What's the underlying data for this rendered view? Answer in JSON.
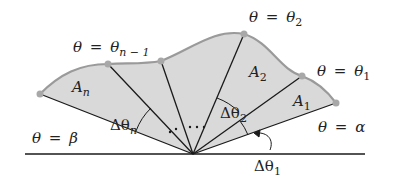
{
  "diagram": {
    "type": "polar-area-sectors",
    "colors": {
      "region_fill": "#d9d9d9",
      "curve_stroke": "#9a9a9a",
      "ray_stroke": "#1a1a1a",
      "point_fill": "#a8a8a8",
      "text": "#222222"
    },
    "origin": {
      "x": 193,
      "y": 154
    },
    "baseline": {
      "x1": 25,
      "x2": 365,
      "y": 154
    },
    "curve_points": [
      {
        "x": 40,
        "y": 94
      },
      {
        "x": 108,
        "y": 64
      },
      {
        "x": 161,
        "y": 61
      },
      {
        "x": 244,
        "y": 34
      },
      {
        "x": 302,
        "y": 76
      },
      {
        "x": 336,
        "y": 103
      }
    ],
    "labels": {
      "theta_n_minus_1": {
        "lhs": "θ",
        "eq": "=",
        "rhs": "θ",
        "sub": "n − 1"
      },
      "theta_2": {
        "lhs": "θ",
        "eq": "=",
        "rhs": "θ",
        "sub": "2"
      },
      "theta_1": {
        "lhs": "θ",
        "eq": "=",
        "rhs": "θ",
        "sub": "1"
      },
      "theta_alpha": {
        "lhs": "θ",
        "eq": "=",
        "rhs": "α"
      },
      "theta_beta": {
        "lhs": "θ",
        "eq": "=",
        "rhs": "β"
      },
      "area_n": {
        "main": "A",
        "sub": "n"
      },
      "area_2": {
        "main": "A",
        "sub": "2"
      },
      "area_1": {
        "main": "A",
        "sub": "1"
      },
      "delta_n": {
        "main": "Δθ",
        "sub": "n"
      },
      "delta_2": {
        "main": "Δθ",
        "sub": "2"
      },
      "delta_1": {
        "main": "Δθ",
        "sub": "1"
      },
      "ellipsis_dots": ". . . . ."
    }
  }
}
